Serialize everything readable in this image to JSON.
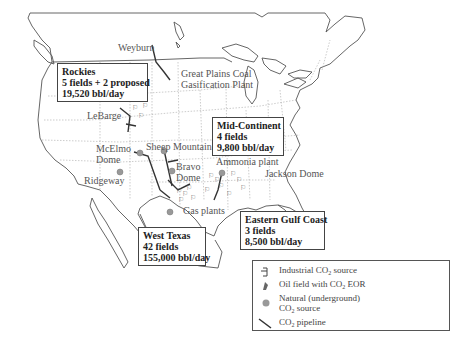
{
  "map": {
    "title": "CO2 EOR operations in the United States",
    "region_boxes": [
      {
        "name": "Rockies",
        "fields": "5 fields + 2 proposed",
        "production": "19,520 bbl/day"
      },
      {
        "name": "Mid-Continent",
        "fields": "4 fields",
        "production": "9,800 bbl/day"
      },
      {
        "name": "West Texas",
        "fields": "42 fields",
        "production": "155,000 bbl/day"
      },
      {
        "name": "Eastern Gulf Coast",
        "fields": "3 fields",
        "production": "8,500 bbl/day"
      }
    ],
    "place_labels": {
      "weyburn": "Weyburn",
      "great_plains_1": "Great Plains Coal",
      "great_plains_2": "Gasification Plant",
      "labarge": "LeBarge",
      "mcelmo_1": "McElmo",
      "mcelmo_2": "Dome",
      "sheep_mountain": "Sheep Mountain",
      "bravo_1": "Bravo",
      "bravo_2": "Dome",
      "ridgeway": "Ridgeway",
      "ammonia": "Ammonia plant",
      "jackson": "Jackson Dome",
      "gas_plants": "Gas plants"
    },
    "colors": {
      "outline": "#555555",
      "state_border": "#aaaaaa",
      "pipeline": "#333333",
      "natural_source": "#999999"
    }
  },
  "legend": {
    "items": [
      {
        "icon": "industrial-source-icon",
        "label_pre": "Industrial CO",
        "sub": "2",
        "label_post": " source"
      },
      {
        "icon": "oil-field-icon",
        "label_pre": "Oil field with CO",
        "sub": "2",
        "label_post": " EOR"
      },
      {
        "icon": "natural-source-icon",
        "label_line1": "Natural (underground)",
        "label_pre": "CO",
        "sub": "2",
        "label_post": " source"
      },
      {
        "icon": "pipeline-icon",
        "label_pre": "CO",
        "sub": "2",
        "label_post": " pipeline"
      }
    ]
  }
}
